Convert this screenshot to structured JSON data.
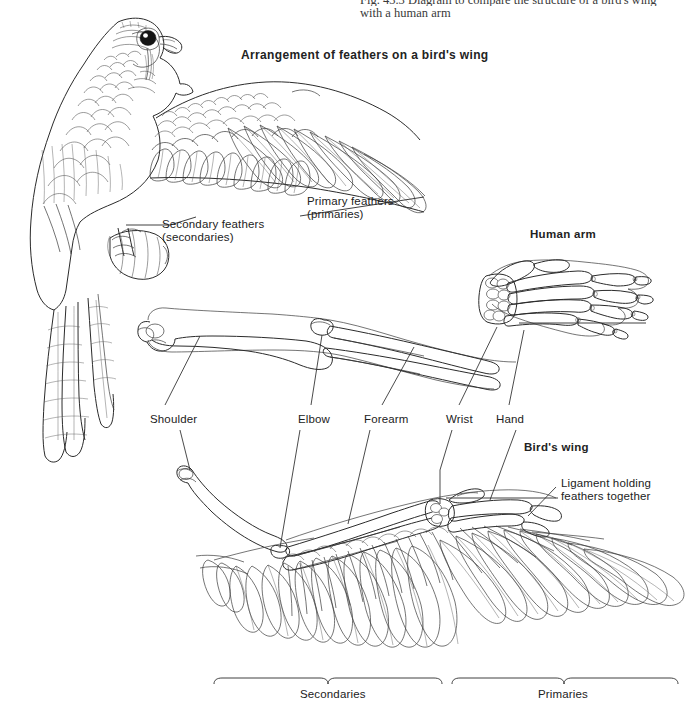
{
  "page": {
    "width": 697,
    "height": 706,
    "background": "#ffffff",
    "ink_color": "#2b2b2b"
  },
  "caption": {
    "figure_number": "Fig. 43.3",
    "line_1": "Fig. 43.3   Diagram to compare the structure of a bird's wing",
    "line_2": "with a human arm"
  },
  "headings": {
    "feather_arrangement": "Arrangement of feathers on a bird's wing",
    "human_arm": "Human arm",
    "birds_wing": "Bird's wing"
  },
  "feather_labels": {
    "primary": "Primary feathers\n(primaries)",
    "secondary": "Secondary feathers\n(secondaries)",
    "ligament": "Ligament holding\nfeathers together"
  },
  "anatomy_labels": [
    {
      "id": "shoulder",
      "text": "Shoulder"
    },
    {
      "id": "elbow",
      "text": "Elbow"
    },
    {
      "id": "forearm",
      "text": "Forearm"
    },
    {
      "id": "wrist",
      "text": "Wrist"
    },
    {
      "id": "hand",
      "text": "Hand"
    }
  ],
  "bracket_labels": {
    "secondaries": "Secondaries",
    "primaries": "Primaries"
  }
}
